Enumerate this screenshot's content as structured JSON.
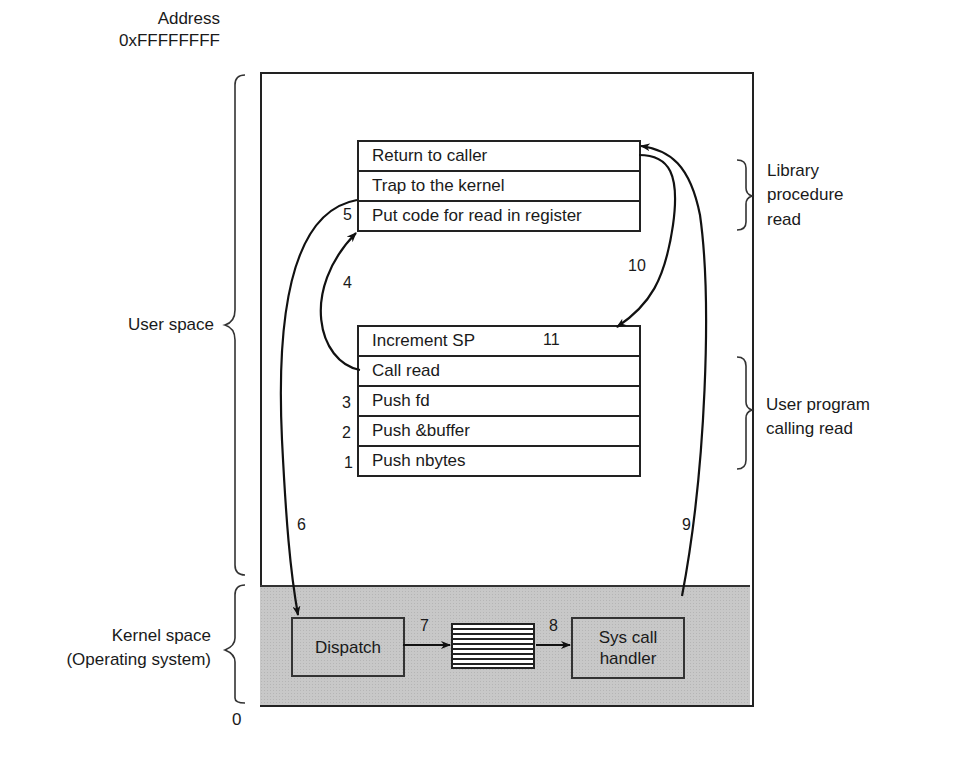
{
  "address_label": {
    "title": "Address",
    "top": "0xFFFFFFFF",
    "bottom": "0"
  },
  "regions": {
    "user_space": "User space",
    "kernel_space_line1": "Kernel space",
    "kernel_space_line2": "(Operating system)"
  },
  "library_procedure": {
    "label_line1": "Library",
    "label_line2": "procedure",
    "label_line3": "read",
    "rows": [
      {
        "text": "Return to caller",
        "step": ""
      },
      {
        "text": "Trap to the kernel",
        "step": ""
      },
      {
        "text": "Put code for read in register",
        "step": "5"
      }
    ]
  },
  "user_program": {
    "label_line1": "User program",
    "label_line2": "calling read",
    "rows": [
      {
        "text": "Increment SP",
        "step": ""
      },
      {
        "text": "Call read",
        "step": ""
      },
      {
        "text": "Push fd",
        "step": "3"
      },
      {
        "text": "Push &buffer",
        "step": "2"
      },
      {
        "text": "Push nbytes",
        "step": "1"
      }
    ]
  },
  "kernel": {
    "dispatch": "Dispatch",
    "sys_call_handler_line1": "Sys call",
    "sys_call_handler_line2": "handler"
  },
  "steps": {
    "s4": "4",
    "s6": "6",
    "s7": "7",
    "s8": "8",
    "s9": "9",
    "s10": "10",
    "s11": "11"
  }
}
